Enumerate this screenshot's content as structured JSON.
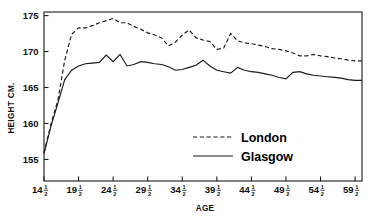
{
  "chart_data": {
    "type": "line",
    "title": "",
    "xlabel": "AGE",
    "ylabel": "HEIGHT CM.",
    "xlim": [
      14.5,
      60.5
    ],
    "ylim": [
      152.0,
      175.5
    ],
    "grid": false,
    "legend_position": "center-right",
    "y_ticks": [
      155,
      160,
      165,
      170,
      175
    ],
    "y_tick_labels": [
      "155",
      "160",
      "165",
      "170",
      "175"
    ],
    "x_ticks": [
      14.5,
      19.5,
      24.5,
      29.5,
      34.5,
      39.5,
      44.5,
      49.5,
      54.5,
      59.5
    ],
    "x_tick_labels": [
      {
        "whole": "14",
        "num": "1",
        "den": "2"
      },
      {
        "whole": "19",
        "num": "1",
        "den": "2"
      },
      {
        "whole": "24",
        "num": "1",
        "den": "2"
      },
      {
        "whole": "29",
        "num": "1",
        "den": "2"
      },
      {
        "whole": "34",
        "num": "1",
        "den": "2"
      },
      {
        "whole": "39",
        "num": "1",
        "den": "2"
      },
      {
        "whole": "44",
        "num": "1",
        "den": "2"
      },
      {
        "whole": "49",
        "num": "1",
        "den": "2"
      },
      {
        "whole": "54",
        "num": "1",
        "den": "2"
      },
      {
        "whole": "59",
        "num": "1",
        "den": "2"
      }
    ],
    "x": [
      14.5,
      15.5,
      16.5,
      17.5,
      18.5,
      19.5,
      20.5,
      21.5,
      22.5,
      23.5,
      24.5,
      25.5,
      26.5,
      27.5,
      28.5,
      29.5,
      30.5,
      31.5,
      32.5,
      33.5,
      34.5,
      35.5,
      36.5,
      37.5,
      38.5,
      39.5,
      40.5,
      41.5,
      42.5,
      43.5,
      44.5,
      45.5,
      46.5,
      47.5,
      48.5,
      49.5,
      50.5,
      51.5,
      52.5,
      53.5,
      54.5,
      55.5,
      56.5,
      57.5,
      58.5,
      59.5,
      60.5
    ],
    "series": [
      {
        "name": "London",
        "style": "dashed",
        "values": [
          155.9,
          159.9,
          163.2,
          168.8,
          172.4,
          173.3,
          173.3,
          173.6,
          174.0,
          174.3,
          174.6,
          174.0,
          174.0,
          173.5,
          173.1,
          172.6,
          172.3,
          171.9,
          170.8,
          171.3,
          172.3,
          173.0,
          171.9,
          171.6,
          171.4,
          170.3,
          170.5,
          172.5,
          171.5,
          171.2,
          171.1,
          170.9,
          170.7,
          170.4,
          170.3,
          170.1,
          169.8,
          169.4,
          169.4,
          169.6,
          169.4,
          169.3,
          169.1,
          169.0,
          168.8,
          168.7,
          168.7
        ]
      },
      {
        "name": "Glasgow",
        "style": "solid",
        "values": [
          155.8,
          159.6,
          162.8,
          166.1,
          167.4,
          168.0,
          168.3,
          168.4,
          168.5,
          169.5,
          168.6,
          169.6,
          168.0,
          168.2,
          168.6,
          168.5,
          168.3,
          168.2,
          167.9,
          167.4,
          167.5,
          167.8,
          168.1,
          168.8,
          168.0,
          167.4,
          167.2,
          167.0,
          167.8,
          167.4,
          167.2,
          167.1,
          166.9,
          166.7,
          166.4,
          166.2,
          167.1,
          167.2,
          166.9,
          166.7,
          166.6,
          166.5,
          166.4,
          166.3,
          166.1,
          166.0,
          166.0
        ]
      }
    ],
    "legend": [
      {
        "label": "London",
        "style": "dashed"
      },
      {
        "label": "Glasgow",
        "style": "solid"
      }
    ]
  }
}
